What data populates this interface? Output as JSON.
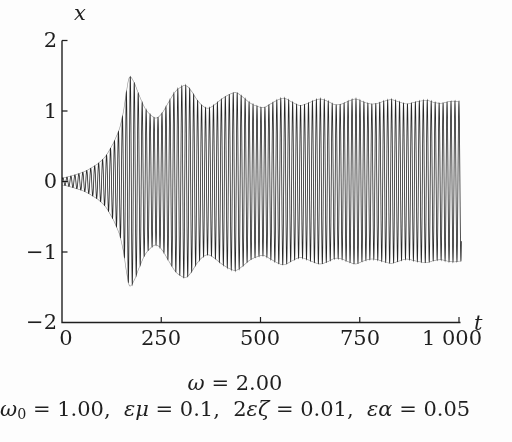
{
  "figure": {
    "background": "#fdfdfd",
    "ink_color": "#1f1f1f"
  },
  "chart_data": {
    "type": "line",
    "title": "",
    "xlabel": "t",
    "ylabel": "x",
    "xlim": [
      0,
      1000
    ],
    "ylim": [
      -2,
      2
    ],
    "x_ticks": [
      0,
      250,
      500,
      750,
      1000
    ],
    "x_tick_labels": [
      "0",
      "250",
      "500",
      "750",
      "1 000"
    ],
    "y_ticks": [
      2,
      1,
      0,
      -1,
      -2
    ],
    "y_tick_labels": [
      "2",
      "1",
      "0",
      "−1",
      "−2"
    ],
    "grid": false,
    "legend": null,
    "series": [
      {
        "name": "x(t)",
        "description": "high-frequency oscillation cos(ωt) whose amplitude envelope grows from ~0.05, peaks at ~1.48 near t≈170, then rings down in decaying beats to a steady amplitude ≈1.15; band is symmetric about x=0",
        "carrier_omega": 2.0,
        "envelope": [
          [
            0,
            0.05
          ],
          [
            30,
            0.09
          ],
          [
            60,
            0.15
          ],
          [
            90,
            0.25
          ],
          [
            110,
            0.36
          ],
          [
            130,
            0.55
          ],
          [
            145,
            0.75
          ],
          [
            155,
            1.0
          ],
          [
            164,
            1.33
          ],
          [
            170,
            1.48
          ],
          [
            180,
            1.42
          ],
          [
            193,
            1.24
          ],
          [
            208,
            1.05
          ],
          [
            222,
            0.95
          ],
          [
            237,
            0.9
          ],
          [
            252,
            0.97
          ],
          [
            268,
            1.12
          ],
          [
            285,
            1.27
          ],
          [
            300,
            1.34
          ],
          [
            312,
            1.36
          ],
          [
            325,
            1.29
          ],
          [
            340,
            1.16
          ],
          [
            355,
            1.07
          ],
          [
            368,
            1.04
          ],
          [
            382,
            1.08
          ],
          [
            400,
            1.16
          ],
          [
            420,
            1.23
          ],
          [
            438,
            1.26
          ],
          [
            455,
            1.2
          ],
          [
            472,
            1.12
          ],
          [
            490,
            1.07
          ],
          [
            508,
            1.05
          ],
          [
            525,
            1.1
          ],
          [
            545,
            1.16
          ],
          [
            560,
            1.18
          ],
          [
            578,
            1.13
          ],
          [
            598,
            1.08
          ],
          [
            615,
            1.1
          ],
          [
            632,
            1.14
          ],
          [
            650,
            1.17
          ],
          [
            668,
            1.14
          ],
          [
            688,
            1.09
          ],
          [
            705,
            1.1
          ],
          [
            722,
            1.14
          ],
          [
            740,
            1.17
          ],
          [
            758,
            1.13
          ],
          [
            778,
            1.1
          ],
          [
            795,
            1.11
          ],
          [
            812,
            1.14
          ],
          [
            830,
            1.16
          ],
          [
            848,
            1.13
          ],
          [
            868,
            1.1
          ],
          [
            885,
            1.12
          ],
          [
            902,
            1.14
          ],
          [
            920,
            1.15
          ],
          [
            938,
            1.12
          ],
          [
            955,
            1.11
          ],
          [
            972,
            1.13
          ],
          [
            988,
            1.14
          ],
          [
            1000,
            1.13
          ]
        ]
      }
    ],
    "annotations": [
      "ω = 2.00",
      "ω₀ = 1.00,  εμ = 0.1,  2εζ = 0.01,  εα = 0.05"
    ]
  },
  "caption": {
    "line1": [
      {
        "t": "ω",
        "i": 1
      },
      {
        "t": " = 2.00"
      }
    ],
    "line2": [
      {
        "t": "ω",
        "i": 1
      },
      {
        "t": "0",
        "sub": 1
      },
      {
        "t": " = 1.00,  "
      },
      {
        "t": "εμ",
        "i": 1
      },
      {
        "t": " = 0.1,  "
      },
      {
        "t": "2"
      },
      {
        "t": "εζ",
        "i": 1
      },
      {
        "t": " = 0.01,  "
      },
      {
        "t": "εα",
        "i": 1
      },
      {
        "t": " = 0.05"
      }
    ]
  }
}
